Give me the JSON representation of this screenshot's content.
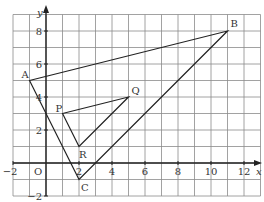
{
  "chart_data": {
    "type": "scatter",
    "title": "",
    "xlabel": "x",
    "ylabel": "y",
    "origin_label": "O",
    "xlim": [
      -2,
      13
    ],
    "ylim": [
      -2,
      9
    ],
    "grid": true,
    "x_ticks": [
      -2,
      2,
      4,
      6,
      8,
      10,
      12
    ],
    "y_ticks": [
      -2,
      2,
      4,
      6,
      8
    ],
    "points": [
      {
        "label": "A",
        "x": -1,
        "y": 5
      },
      {
        "label": "B",
        "x": 11,
        "y": 8
      },
      {
        "label": "C",
        "x": 2,
        "y": -1
      },
      {
        "label": "P",
        "x": 1,
        "y": 3
      },
      {
        "label": "Q",
        "x": 5,
        "y": 4
      },
      {
        "label": "R",
        "x": 2,
        "y": 1
      }
    ],
    "polygons": [
      {
        "name": "ABC",
        "vertices": [
          "A",
          "B",
          "C"
        ]
      },
      {
        "name": "PQR",
        "vertices": [
          "P",
          "Q",
          "R"
        ]
      }
    ]
  },
  "style": {
    "grid_color": "#8a8a8a",
    "axis_color": "#222222",
    "line_color": "#222222",
    "background": "#ffffff"
  }
}
